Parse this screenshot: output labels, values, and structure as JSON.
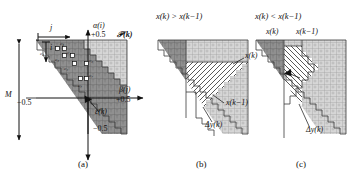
{
  "figure": {
    "kind": "technical-diagram",
    "background_color": "#ffffff",
    "ink_color": "#111111",
    "fill_dark": "#8e8e8e",
    "fill_light": "#d4d4d4",
    "fill_hatch_bg": "#ffffff",
    "grid_line": "#6b6b6b"
  },
  "panels": [
    {
      "id": "a",
      "caption": "(a)",
      "title": "",
      "axis": {
        "vertical_label": "α(i)",
        "vertical_top_value": "+0.5",
        "vertical_bottom_value": "−0.5",
        "horizontal_label": "β(j)",
        "horizontal_value": "+0.5",
        "origin_label": "ε(k)",
        "set_label": "𝒫(k)"
      },
      "index_arrows": {
        "horizontal": "j",
        "vertical": "i"
      },
      "left_brace": {
        "label": "M",
        "tick_value": "−0.5"
      },
      "cells": [
        {
          "name": "c1",
          "label": "c₁"
        },
        {
          "name": "c2",
          "label": "c₂"
        },
        {
          "name": "c3",
          "label": "c₃"
        },
        {
          "name": "c4",
          "label": "c₄"
        },
        {
          "name": "c5",
          "label": "c₅"
        },
        {
          "name": "c6",
          "label": "c₆"
        },
        {
          "name": "c7",
          "label": "c₇"
        }
      ]
    },
    {
      "id": "b",
      "caption": "(b)",
      "title": "x(k) > x(k−1)",
      "labels": {
        "upper": "x(k)",
        "lower": "x(k−1)",
        "delta": "Δy(k)"
      }
    },
    {
      "id": "c",
      "caption": "(c)",
      "title": "x(k) < x(k−1)",
      "labels": {
        "top_left": "x(k)",
        "top_right": "x(k−1)",
        "delta": "Δy(k)"
      }
    }
  ]
}
